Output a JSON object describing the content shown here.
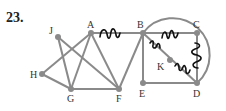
{
  "problem_number": "23.",
  "edge_color": "#8a8a8a",
  "squiggle_color": "#111111",
  "nodes": [
    {
      "id": "J",
      "label": "J",
      "x": 58,
      "y": 37,
      "lx": 49,
      "ly": 34
    },
    {
      "id": "A",
      "label": "A",
      "x": 91,
      "y": 33,
      "lx": 87,
      "ly": 28
    },
    {
      "id": "B",
      "label": "B",
      "x": 143,
      "y": 33,
      "lx": 137,
      "ly": 28
    },
    {
      "id": "C",
      "label": "C",
      "x": 197,
      "y": 33,
      "lx": 193,
      "ly": 28
    },
    {
      "id": "H",
      "label": "H",
      "x": 42,
      "y": 74,
      "lx": 30,
      "ly": 78
    },
    {
      "id": "K",
      "label": "K",
      "x": 170,
      "y": 60,
      "lx": 157,
      "ly": 70
    },
    {
      "id": "G",
      "label": "G",
      "x": 71,
      "y": 89,
      "lx": 67,
      "ly": 102
    },
    {
      "id": "F",
      "label": "F",
      "x": 119,
      "y": 89,
      "lx": 116,
      "ly": 102
    },
    {
      "id": "E",
      "label": "E",
      "x": 143,
      "y": 83,
      "lx": 139,
      "ly": 97
    },
    {
      "id": "D",
      "label": "D",
      "x": 197,
      "y": 83,
      "lx": 193,
      "ly": 97
    }
  ],
  "edges": [
    [
      "J",
      "G"
    ],
    [
      "J",
      "F"
    ],
    [
      "H",
      "A"
    ],
    [
      "H",
      "G"
    ],
    [
      "G",
      "A"
    ],
    [
      "G",
      "F"
    ],
    [
      "A",
      "F"
    ],
    [
      "A",
      "B"
    ],
    [
      "B",
      "F"
    ],
    [
      "B",
      "C"
    ],
    [
      "B",
      "E"
    ],
    [
      "B",
      "K"
    ],
    [
      "K",
      "D"
    ],
    [
      "C",
      "D"
    ],
    [
      "E",
      "D"
    ]
  ],
  "marked_edges": [
    "A-B",
    "B-C",
    "B-K",
    "K-D",
    "C-D"
  ],
  "circle": {
    "cx": 175,
    "cy": 57,
    "r": 37
  }
}
